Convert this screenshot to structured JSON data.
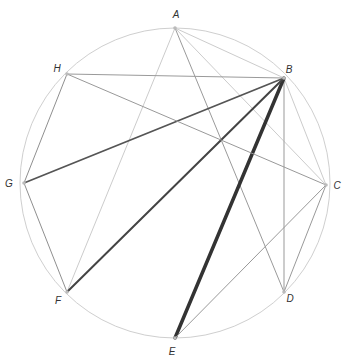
{
  "diagram": {
    "title": "",
    "circle": {
      "cx": 175,
      "cy": 183,
      "r": 155,
      "color": "#cfcfcf",
      "width": 1
    },
    "vertices": [
      {
        "id": "A",
        "label": "A",
        "x": 175,
        "y": 28,
        "lx": 176,
        "ly": 18
      },
      {
        "id": "B",
        "label": "B",
        "x": 284,
        "y": 78,
        "lx": 289,
        "ly": 73
      },
      {
        "id": "C",
        "label": "C",
        "x": 326,
        "y": 185,
        "lx": 337,
        "ly": 189
      },
      {
        "id": "D",
        "label": "D",
        "x": 284,
        "y": 292,
        "lx": 290,
        "ly": 302
      },
      {
        "id": "E",
        "label": "E",
        "x": 175,
        "y": 338,
        "lx": 172,
        "ly": 355
      },
      {
        "id": "F",
        "label": "F",
        "x": 67,
        "y": 292,
        "lx": 58,
        "ly": 304
      },
      {
        "id": "G",
        "label": "G",
        "x": 24,
        "y": 183,
        "lx": 9,
        "ly": 187
      },
      {
        "id": "H",
        "label": "H",
        "x": 67,
        "y": 74,
        "lx": 57,
        "ly": 72
      }
    ],
    "edges": [
      {
        "from": "A",
        "to": "B",
        "color": "#cccccc",
        "width": 1
      },
      {
        "from": "A",
        "to": "C",
        "color": "#cccccc",
        "width": 1
      },
      {
        "from": "A",
        "to": "D",
        "color": "#9a9a9a",
        "width": 1
      },
      {
        "from": "A",
        "to": "F",
        "color": "#cccccc",
        "width": 1
      },
      {
        "from": "B",
        "to": "C",
        "color": "#cccccc",
        "width": 1
      },
      {
        "from": "B",
        "to": "D",
        "color": "#aaaaaa",
        "width": 1.2
      },
      {
        "from": "B",
        "to": "E",
        "color": "#333333",
        "width": 3.5
      },
      {
        "from": "B",
        "to": "F",
        "color": "#444444",
        "width": 2
      },
      {
        "from": "B",
        "to": "G",
        "color": "#555555",
        "width": 1.8
      },
      {
        "from": "B",
        "to": "H",
        "color": "#9a9a9a",
        "width": 1.2
      },
      {
        "from": "C",
        "to": "D",
        "color": "#999999",
        "width": 1
      },
      {
        "from": "C",
        "to": "E",
        "color": "#999999",
        "width": 1
      },
      {
        "from": "C",
        "to": "H",
        "color": "#999999",
        "width": 1
      },
      {
        "from": "F",
        "to": "G",
        "color": "#8f8f8f",
        "width": 1
      },
      {
        "from": "G",
        "to": "H",
        "color": "#8f8f8f",
        "width": 1
      }
    ],
    "vertex_dot_color": "#bbbbbb"
  }
}
